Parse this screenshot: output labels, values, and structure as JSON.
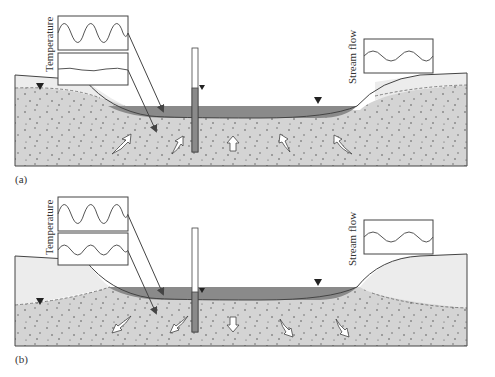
{
  "figure": {
    "panels": [
      {
        "id": "a",
        "label": "(a)",
        "description": "Gaining stream: groundwater flows upward into stream",
        "labels": {
          "temperature": "Temperature",
          "stream_flow": "Stream flow"
        },
        "temperature_insets": [
          "strong diurnal oscillation (stream)",
          "damped oscillation (sediment)"
        ],
        "flow_direction": "upward"
      },
      {
        "id": "b",
        "label": "(b)",
        "description": "Losing stream: stream water flows downward into aquifer",
        "labels": {
          "temperature": "Temperature",
          "stream_flow": "Stream flow"
        },
        "temperature_insets": [
          "strong diurnal oscillation (stream)",
          "moderate oscillation (sediment)"
        ],
        "flow_direction": "downward"
      }
    ],
    "colors": {
      "sediment": "#d4d4d4",
      "unsaturated": "#ececec",
      "water": "#8a8a8a",
      "outline": "#444444",
      "dots": "#666666"
    }
  }
}
